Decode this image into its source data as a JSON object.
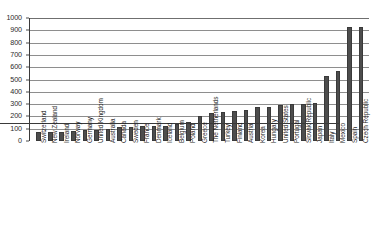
{
  "chart_data": {
    "type": "bar",
    "title": "",
    "xlabel": "",
    "ylabel": "",
    "ylim": [
      0,
      1000
    ],
    "ytick_step": 100,
    "grid": true,
    "legend": "none",
    "bar_color": "#4d4d4d",
    "categories": [
      "Switzerland",
      "New Zealand",
      "Ireland",
      "Norway",
      "Germany",
      "United Kingdom",
      "Australia",
      "Canada",
      "Sweden",
      "France",
      "Denmark",
      "Iceland",
      "Belgium",
      "Poland",
      "Greece",
      "The Netherlands",
      "Turkey",
      "Finland",
      "Austria",
      "Korea",
      "Hungary",
      "United States",
      "Portugal",
      "Slovak Republic",
      "Japan",
      "Italy",
      "Mexico",
      "Spain",
      "Czech Republic"
    ],
    "values": [
      70,
      72,
      74,
      80,
      88,
      90,
      100,
      110,
      118,
      120,
      120,
      125,
      140,
      155,
      200,
      230,
      235,
      245,
      255,
      275,
      280,
      290,
      300,
      305,
      310,
      530,
      570,
      930,
      930
    ],
    "ytick_labels": [
      "0",
      "100",
      "200",
      "300",
      "400",
      "500",
      "600",
      "700",
      "800",
      "900",
      "1000"
    ]
  },
  "axis": {
    "y_max": 1000,
    "y_min": 0
  }
}
